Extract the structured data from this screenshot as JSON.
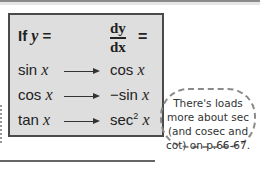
{
  "table": {
    "header_left_prefix": "If ",
    "header_left_var": "y",
    "header_left_suffix": " =",
    "header_right_numerator": "dy",
    "header_right_denominator": "dx",
    "header_right_suffix": "=",
    "rows": [
      {
        "fn": "sin",
        "var": "x",
        "deriv_fn": "cos",
        "deriv_var": "x",
        "deriv_sup": ""
      },
      {
        "fn": "cos",
        "var": "x",
        "deriv_fn": "−sin",
        "deriv_var": "x",
        "deriv_sup": ""
      },
      {
        "fn": "tan",
        "var": "x",
        "deriv_fn": "sec",
        "deriv_var": "x",
        "deriv_sup": "2"
      }
    ],
    "arrow_icon": "right-arrow"
  },
  "callout": {
    "line1": "There's loads",
    "line2": "more about sec",
    "line3": "(and cosec and",
    "line4": "cot) on p.66-67."
  },
  "colors": {
    "panel_bg": "#dedede",
    "panel_border": "#4a4a4a",
    "text": "#222222"
  }
}
